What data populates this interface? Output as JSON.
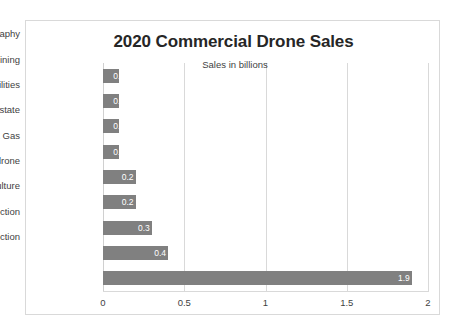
{
  "chart_data": {
    "type": "bar",
    "orientation": "horizontal",
    "title": "2020 Commercial Drone Sales",
    "annotation": "Sales in billions",
    "xlabel": "",
    "ylabel": "",
    "xlim": [
      0,
      2
    ],
    "categories": [
      "Videography",
      "Mining",
      "Utilities",
      "Realestate",
      "Oil & Gas",
      "Counter drone",
      "Agriculture",
      "Inspection",
      "Construction"
    ],
    "values": [
      0.1,
      0.1,
      0.1,
      0.1,
      0.2,
      0.2,
      0.3,
      0.4,
      1.9
    ],
    "value_labels": [
      "0.1",
      "0.1",
      "0.1",
      "0.1",
      "0.2",
      "0.2",
      "0.3",
      "0.4",
      "1.9"
    ],
    "xticks": [
      0,
      0.5,
      1,
      1.5,
      2
    ],
    "xtick_labels": [
      "0",
      "0.5",
      "1",
      "1.5",
      "2"
    ],
    "grid": "vertical",
    "legend": null,
    "series_color": "#808080",
    "grid_color": "#d9d9d9",
    "label_color": "#3f3f3f",
    "data_label_color": "#ffffff"
  }
}
